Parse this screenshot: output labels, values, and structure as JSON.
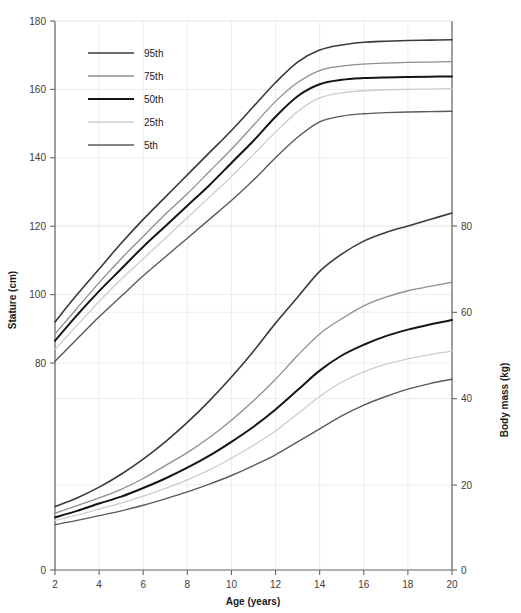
{
  "chart_data": {
    "type": "line",
    "title": "",
    "subtitle": "",
    "xlabel": "Age (years)",
    "ylabel": "Stature (cm)",
    "y2label": "Body mass (kg)",
    "grid": true,
    "legend_position": "top-left",
    "xlim": [
      2,
      20
    ],
    "xticks": [
      2,
      4,
      6,
      8,
      10,
      12,
      14,
      16,
      18,
      20
    ],
    "xtick_labels": [
      "2",
      "4",
      "6",
      "8",
      "10",
      "12",
      "14",
      "16",
      "18",
      "20"
    ],
    "ylim": [
      0,
      180
    ],
    "yticks": [
      0,
      80,
      100,
      120,
      140,
      160,
      180
    ],
    "ytick_labels": [
      "0",
      "80",
      "100",
      "120",
      "140",
      "160",
      "180"
    ],
    "y2lim": [
      0,
      90
    ],
    "y2ticks": [
      0,
      20,
      40,
      60,
      80
    ],
    "y2tick_labels": [
      "0",
      "20",
      "40",
      "60",
      "80"
    ],
    "y_axis_broken": true,
    "legend": [
      {
        "label": "95th",
        "color": "#3a3a3a",
        "width": 1.6
      },
      {
        "label": "75th",
        "color": "#8f8f8f",
        "width": 1.3
      },
      {
        "label": "50th",
        "color": "#151515",
        "width": 2.0
      },
      {
        "label": "25th",
        "color": "#cdcdcd",
        "width": 1.3
      },
      {
        "label": "5th",
        "color": "#5a5a5a",
        "width": 1.4
      }
    ],
    "x": [
      2,
      3,
      4,
      5,
      6,
      7,
      8,
      9,
      10,
      11,
      12,
      13,
      14,
      15,
      16,
      17,
      18,
      19,
      20
    ],
    "stature_series": [
      {
        "name": "95th",
        "unit": "cm",
        "color": "#3a3a3a",
        "values": [
          92.0,
          100.0,
          107.5,
          115.0,
          122.0,
          128.5,
          135.0,
          141.5,
          148.0,
          155.0,
          162.0,
          168.0,
          171.5,
          173.0,
          173.8,
          174.1,
          174.3,
          174.4,
          174.5
        ]
      },
      {
        "name": "75th",
        "unit": "cm",
        "color": "#8f8f8f",
        "values": [
          88.5,
          96.0,
          103.5,
          110.5,
          117.0,
          123.5,
          129.5,
          136.0,
          142.5,
          149.5,
          156.5,
          162.0,
          165.5,
          166.8,
          167.4,
          167.7,
          167.9,
          168.0,
          168.1
        ]
      },
      {
        "name": "50th",
        "unit": "cm",
        "color": "#151515",
        "values": [
          86.5,
          94.0,
          101.0,
          107.5,
          114.0,
          120.0,
          126.0,
          132.0,
          138.5,
          145.0,
          152.0,
          158.0,
          161.5,
          162.8,
          163.3,
          163.5,
          163.6,
          163.7,
          163.8
        ]
      },
      {
        "name": "25th",
        "unit": "cm",
        "color": "#cdcdcd",
        "values": [
          84.0,
          91.0,
          98.0,
          104.5,
          110.5,
          116.5,
          122.5,
          128.5,
          134.5,
          141.0,
          147.5,
          153.5,
          157.5,
          159.0,
          159.6,
          159.9,
          160.0,
          160.1,
          160.2
        ]
      },
      {
        "name": "5th",
        "unit": "cm",
        "color": "#5a5a5a",
        "values": [
          80.5,
          87.0,
          93.5,
          99.5,
          105.5,
          111.0,
          116.5,
          122.0,
          127.5,
          133.5,
          140.0,
          146.0,
          150.5,
          152.2,
          152.9,
          153.2,
          153.4,
          153.5,
          153.6
        ]
      }
    ],
    "mass_series": [
      {
        "name": "95th",
        "unit": "kg",
        "color": "#3a3a3a",
        "values": [
          15.0,
          17.0,
          19.5,
          22.5,
          26.0,
          30.0,
          34.5,
          39.5,
          45.0,
          51.0,
          57.5,
          63.5,
          69.5,
          73.5,
          76.5,
          78.5,
          80.0,
          81.5,
          83.0
        ]
      },
      {
        "name": "75th",
        "unit": "kg",
        "color": "#8f8f8f",
        "values": [
          13.5,
          15.2,
          17.0,
          19.0,
          21.5,
          24.5,
          27.5,
          31.0,
          35.0,
          39.5,
          44.5,
          50.0,
          55.0,
          58.5,
          61.5,
          63.5,
          65.0,
          66.0,
          67.0
        ]
      },
      {
        "name": "50th",
        "unit": "kg",
        "color": "#151515",
        "values": [
          12.5,
          14.0,
          15.7,
          17.3,
          19.3,
          21.5,
          24.0,
          26.8,
          30.0,
          33.5,
          37.5,
          42.0,
          46.5,
          50.0,
          52.5,
          54.5,
          56.0,
          57.2,
          58.2
        ]
      },
      {
        "name": "25th",
        "unit": "kg",
        "color": "#cdcdcd",
        "values": [
          11.8,
          13.0,
          14.4,
          15.8,
          17.4,
          19.2,
          21.2,
          23.5,
          26.2,
          29.2,
          32.5,
          36.5,
          40.5,
          43.8,
          46.2,
          48.0,
          49.2,
          50.2,
          51.0
        ]
      },
      {
        "name": "5th",
        "unit": "kg",
        "color": "#5a5a5a",
        "values": [
          10.8,
          11.8,
          12.9,
          14.0,
          15.3,
          16.8,
          18.4,
          20.2,
          22.2,
          24.5,
          27.0,
          30.0,
          33.0,
          36.0,
          38.5,
          40.5,
          42.2,
          43.5,
          44.5
        ]
      }
    ]
  },
  "axes": {
    "x_title": "Age (years)",
    "y_left_title": "Stature (cm)",
    "y_right_title": "Body mass (kg)"
  },
  "colors": {
    "axis": "#666666",
    "grid": "#ededed",
    "text": "#2a2a2a",
    "background": "#ffffff"
  }
}
